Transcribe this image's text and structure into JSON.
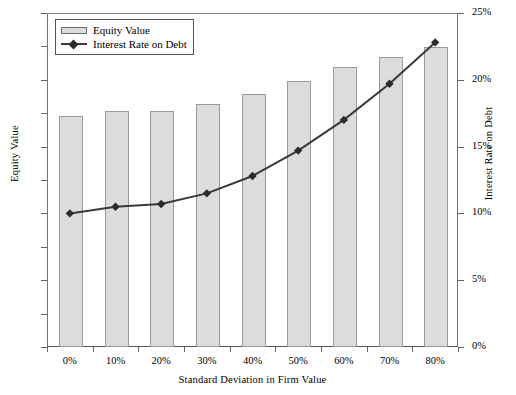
{
  "chart_data": {
    "type": "bar",
    "title": "",
    "xlabel": "Standard Deviation in Firm Value",
    "ylabel": "Equity Value",
    "y2label": "Interest Rate on Debt",
    "categories": [
      "0%",
      "10%",
      "20%",
      "30%",
      "40%",
      "50%",
      "60%",
      "70%",
      "80%"
    ],
    "ylim": [
      0,
      100
    ],
    "y2lim": [
      0,
      25
    ],
    "yticks": [
      "0",
      "10",
      "20",
      "30",
      "40",
      "50",
      "60",
      "70",
      "80",
      "90",
      "100"
    ],
    "y2ticks": [
      "0%",
      "5%",
      "10%",
      "15%",
      "20%",
      "25%"
    ],
    "grid": false,
    "legend_position": "top-left",
    "series": [
      {
        "name": "Equity Value",
        "kind": "bar",
        "axis": "left",
        "color": "#dcdcdc",
        "edge_color": "#9a9a9a",
        "values": [
          69.5,
          71,
          71,
          73,
          76,
          80,
          84,
          87,
          90
        ]
      },
      {
        "name": "Interest Rate on Debt",
        "kind": "line",
        "axis": "right",
        "color": "#3a3a3a",
        "marker": "diamond",
        "values": [
          10.0,
          10.5,
          10.7,
          11.5,
          12.8,
          14.7,
          17.0,
          19.7,
          22.8
        ]
      }
    ]
  },
  "legend": {
    "items": [
      {
        "label": "Equity Value",
        "type": "bar-swatch"
      },
      {
        "label": "Interest Rate on Debt",
        "type": "line-marker-swatch"
      }
    ]
  },
  "colors": {
    "bar_fill": "#dcdcdc",
    "bar_edge": "#9a9a9a",
    "line": "#3a3a3a",
    "axis": "#666666",
    "background": "#ffffff"
  }
}
